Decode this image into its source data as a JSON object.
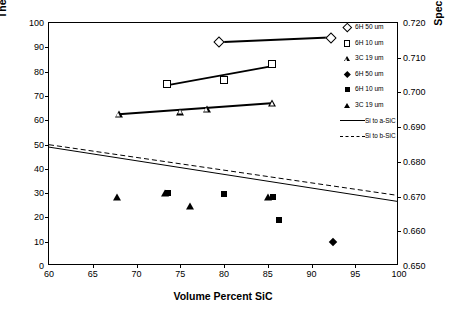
{
  "chart_data": {
    "type": "scatter",
    "title": "",
    "xlabel": "Volume Percent SiC",
    "ylabel": "Thermal Diffusivity (mm^2/s)",
    "y2label": "Specific Heat (J/g K)",
    "xlim": [
      60,
      100
    ],
    "ylim": [
      0,
      100
    ],
    "y2lim": [
      0.65,
      0.72
    ],
    "xticks": [
      "60",
      "65",
      "70",
      "75",
      "80",
      "85",
      "90",
      "95",
      "100"
    ],
    "yticks": [
      "0",
      "10",
      "20",
      "30",
      "40",
      "50",
      "60",
      "70",
      "80",
      "90",
      "100"
    ],
    "y2ticks": [
      "0.650",
      "0.660",
      "0.670",
      "0.680",
      "0.690",
      "0.700",
      "0.710",
      "0.720"
    ],
    "grid": false,
    "legend_position": "right",
    "series": [
      {
        "name": "6H 50 um",
        "marker": "open-diamond",
        "axis": "left",
        "points": [
          [
            79.4,
            92.0
          ],
          [
            92.2,
            94.0
          ]
        ],
        "trendline": true
      },
      {
        "name": "6H 10 um",
        "marker": "open-square",
        "axis": "left",
        "points": [
          [
            73.5,
            75.0
          ],
          [
            80.0,
            76.5
          ],
          [
            85.5,
            83.0
          ]
        ],
        "trendline": true
      },
      {
        "name": "3C 19 um",
        "marker": "open-triangle",
        "axis": "left",
        "points": [
          [
            68.0,
            62.5
          ],
          [
            75.0,
            63.5
          ],
          [
            78.0,
            64.5
          ],
          [
            85.5,
            67.0
          ]
        ],
        "trendline": true
      },
      {
        "name": "6H 50 um",
        "marker": "filled-diamond",
        "axis": "left",
        "points": [
          [
            92.5,
            10.0
          ]
        ],
        "trendline": false
      },
      {
        "name": "6H 10 um",
        "marker": "filled-square",
        "axis": "left",
        "points": [
          [
            73.6,
            30.0
          ],
          [
            80.0,
            29.5
          ],
          [
            85.6,
            28.5
          ],
          [
            86.3,
            19.0
          ]
        ],
        "trendline": false
      },
      {
        "name": "3C 19 um",
        "marker": "filled-triangle",
        "axis": "left",
        "points": [
          [
            67.8,
            28.5
          ],
          [
            73.3,
            30.0
          ],
          [
            76.1,
            24.5
          ],
          [
            85.0,
            28.3
          ]
        ],
        "trendline": false
      },
      {
        "name": "Si to a-SiC",
        "marker": "solid-line",
        "axis": "right",
        "points": [
          [
            60,
            48.5
          ],
          [
            100,
            26.0
          ]
        ],
        "trendline": false
      },
      {
        "name": "Si to b-SiC",
        "marker": "dashed-line",
        "axis": "right",
        "points": [
          [
            60,
            49.5
          ],
          [
            100,
            28.5
          ]
        ],
        "trendline": false
      }
    ],
    "legend": [
      {
        "label": "6H 50 um",
        "marker": "open-diamond"
      },
      {
        "label": "6H 10 um",
        "marker": "open-square"
      },
      {
        "label": "3C 19 um",
        "marker": "open-triangle"
      },
      {
        "label": "6H 50 um",
        "marker": "filled-diamond"
      },
      {
        "label": "6H 10 um",
        "marker": "filled-square"
      },
      {
        "label": "3C 19 um",
        "marker": "filled-triangle"
      },
      {
        "label": "Si to a-SiC",
        "marker": "solid-line"
      },
      {
        "label": "Si to b-SiC",
        "marker": "dashed-line"
      }
    ],
    "colors": {
      "ink": "#000000",
      "background": "#ffffff"
    }
  }
}
